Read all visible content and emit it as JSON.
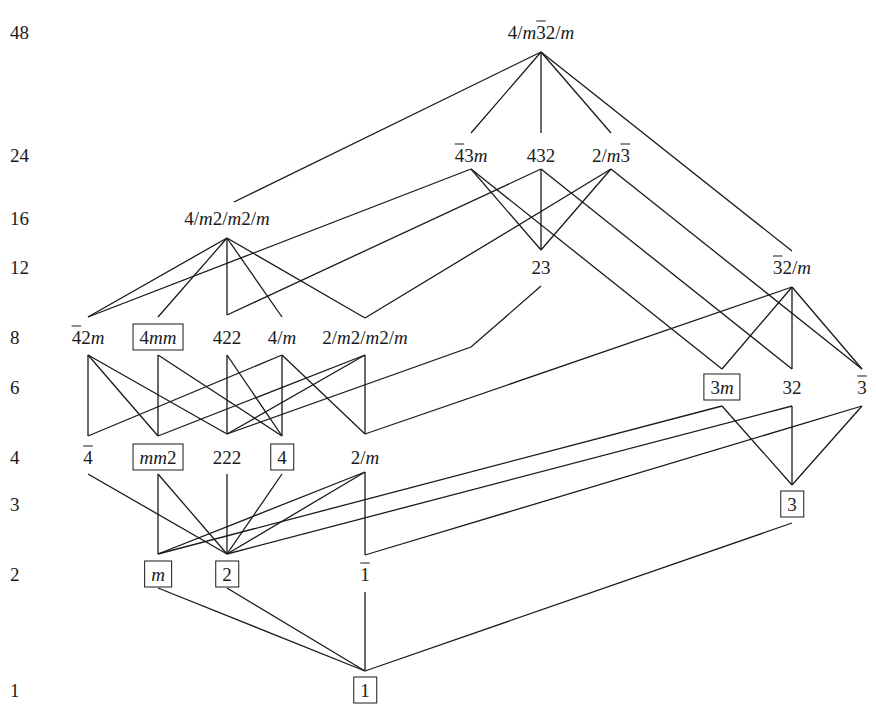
{
  "figure": {
    "order_axis_labels": [
      {
        "value": "48",
        "y": 32
      },
      {
        "value": "24",
        "y": 155
      },
      {
        "value": "16",
        "y": 218
      },
      {
        "value": "12",
        "y": 267
      },
      {
        "value": "8",
        "y": 337
      },
      {
        "value": "6",
        "y": 387
      },
      {
        "value": "4",
        "y": 457
      },
      {
        "value": "3",
        "y": 504
      },
      {
        "value": "2",
        "y": 574
      },
      {
        "value": "1",
        "y": 690
      }
    ],
    "nodes": [
      {
        "id": "m3m",
        "html": "4/<i>m</i><span class='ob'>3</span>2/<i>m</i>",
        "text": "4/m̅2/m (4/m 3̅ 2/m)",
        "x": 541,
        "y": 32,
        "boxed": false,
        "order": 48
      },
      {
        "id": "-43m",
        "html": "<span class='ob'>4</span>3<i>m</i>",
        "text": "4̅3m",
        "x": 471,
        "y": 155,
        "boxed": false,
        "order": 24
      },
      {
        "id": "432",
        "html": "432",
        "text": "432",
        "x": 541,
        "y": 155,
        "boxed": false,
        "order": 24
      },
      {
        "id": "m-3",
        "html": "2/<i>m</i><span class='ob'>3</span>",
        "text": "2/m3̅",
        "x": 611,
        "y": 155,
        "boxed": false,
        "order": 24
      },
      {
        "id": "4/mmm",
        "html": "4/<i>m</i>2/<i>m</i>2/<i>m</i>",
        "text": "4/m2/m2/m",
        "x": 227,
        "y": 218,
        "boxed": false,
        "order": 16
      },
      {
        "id": "23",
        "html": "23",
        "text": "23",
        "x": 541,
        "y": 267,
        "boxed": false,
        "order": 12
      },
      {
        "id": "-3m",
        "html": "<span class='ob'>3</span>2/<i>m</i>",
        "text": "3̅2/m",
        "x": 792,
        "y": 267,
        "boxed": false,
        "order": 12
      },
      {
        "id": "-42m",
        "html": "<span class='ob'>4</span>2<i>m</i>",
        "text": "4̅2m",
        "x": 88,
        "y": 337,
        "boxed": false,
        "order": 8
      },
      {
        "id": "4mm",
        "html": "4<i>mm</i>",
        "text": "4mm",
        "x": 158,
        "y": 337,
        "boxed": true,
        "order": 8
      },
      {
        "id": "422",
        "html": "422",
        "text": "422",
        "x": 227,
        "y": 337,
        "boxed": false,
        "order": 8
      },
      {
        "id": "4/m",
        "html": "4/<i>m</i>",
        "text": "4/m",
        "x": 282,
        "y": 337,
        "boxed": false,
        "order": 8
      },
      {
        "id": "mmm",
        "html": "2/<i>m</i>2/<i>m</i>2/<i>m</i>",
        "text": "2/m2/m2/m",
        "x": 365,
        "y": 337,
        "boxed": false,
        "order": 8
      },
      {
        "id": "3m",
        "html": "3<i>m</i>",
        "text": "3m",
        "x": 722,
        "y": 387,
        "boxed": true,
        "order": 6
      },
      {
        "id": "32",
        "html": "32",
        "text": "32",
        "x": 792,
        "y": 387,
        "boxed": false,
        "order": 6
      },
      {
        "id": "-3",
        "html": "<span class='ob'>3</span>",
        "text": "3̅",
        "x": 862,
        "y": 387,
        "boxed": false,
        "order": 6
      },
      {
        "id": "-4",
        "html": "<span class='ob'>4</span>",
        "text": "4̅",
        "x": 88,
        "y": 457,
        "boxed": false,
        "order": 4
      },
      {
        "id": "mm2",
        "html": "<i>mm</i>2",
        "text": "mm2",
        "x": 158,
        "y": 457,
        "boxed": true,
        "order": 4
      },
      {
        "id": "222",
        "html": "222",
        "text": "222",
        "x": 227,
        "y": 457,
        "boxed": false,
        "order": 4
      },
      {
        "id": "4",
        "html": "4",
        "text": "4",
        "x": 282,
        "y": 457,
        "boxed": true,
        "order": 4
      },
      {
        "id": "2/m",
        "html": "2/<i>m</i>",
        "text": "2/m",
        "x": 365,
        "y": 457,
        "boxed": false,
        "order": 4
      },
      {
        "id": "3",
        "html": "3",
        "text": "3",
        "x": 792,
        "y": 504,
        "boxed": true,
        "order": 3
      },
      {
        "id": "m",
        "html": "<i>m</i>",
        "text": "m",
        "x": 158,
        "y": 574,
        "boxed": true,
        "order": 2
      },
      {
        "id": "2",
        "html": "2",
        "text": "2",
        "x": 227,
        "y": 574,
        "boxed": true,
        "order": 2
      },
      {
        "id": "-1",
        "html": "<span class='ob'>1</span>",
        "text": "1̅",
        "x": 365,
        "y": 574,
        "boxed": false,
        "order": 2
      },
      {
        "id": "1",
        "html": "1",
        "text": "1",
        "x": 365,
        "y": 690,
        "boxed": true,
        "order": 1
      }
    ],
    "anchors": {
      "m3m": {
        "b": [
          541,
          52
        ]
      },
      "-43m": {
        "t": [
          471,
          133
        ],
        "b": [
          471,
          169
        ]
      },
      "432": {
        "t": [
          541,
          133
        ],
        "b": [
          541,
          169
        ]
      },
      "m-3": {
        "t": [
          611,
          133
        ],
        "b": [
          611,
          169
        ]
      },
      "4/mmm": {
        "t": [
          234,
          202
        ],
        "b": [
          227,
          238
        ]
      },
      "23": {
        "t": [
          541,
          250
        ],
        "b": [
          541,
          286
        ]
      },
      "-3m": {
        "t": [
          792,
          251
        ],
        "b": [
          792,
          287
        ]
      },
      "-42m": {
        "t": [
          88,
          317
        ],
        "b": [
          88,
          355
        ]
      },
      "4mm": {
        "t": [
          158,
          317
        ],
        "b": [
          158,
          355
        ]
      },
      "422": {
        "t": [
          227,
          315
        ],
        "b": [
          227,
          355
        ]
      },
      "4/m": {
        "t": [
          282,
          317
        ],
        "b": [
          282,
          355
        ]
      },
      "mmm": {
        "t": [
          365,
          318
        ],
        "b": [
          365,
          355
        ]
      },
      "3m": {
        "t": [
          722,
          369
        ],
        "b": [
          722,
          406
        ]
      },
      "32": {
        "t": [
          792,
          369
        ],
        "b": [
          792,
          406
        ]
      },
      "-3": {
        "t": [
          862,
          369
        ],
        "b": [
          862,
          406
        ]
      },
      "-4": {
        "t": [
          88,
          436
        ],
        "b": [
          88,
          474
        ]
      },
      "mm2": {
        "t": [
          158,
          436
        ],
        "b": [
          158,
          474
        ]
      },
      "222": {
        "t": [
          227,
          434
        ],
        "b": [
          227,
          474
        ]
      },
      "4": {
        "t": [
          282,
          436
        ],
        "b": [
          282,
          474
        ]
      },
      "2/m": {
        "t": [
          365,
          434
        ],
        "b": [
          365,
          472
        ]
      },
      "3": {
        "t": [
          792,
          485
        ],
        "b": [
          792,
          523
        ]
      },
      "m": {
        "t": [
          158,
          554
        ],
        "b": [
          158,
          588
        ]
      },
      "2": {
        "t": [
          227,
          554
        ],
        "b": [
          227,
          588
        ]
      },
      "-1": {
        "t": [
          365,
          555
        ],
        "b": [
          365,
          592
        ]
      },
      "1": {
        "t": [
          365,
          671
        ]
      }
    },
    "edges": [
      [
        "m3m",
        "4/mmm"
      ],
      [
        "m3m",
        "-43m"
      ],
      [
        "m3m",
        "432"
      ],
      [
        "m3m",
        "m-3"
      ],
      [
        "m3m",
        "-3m"
      ],
      [
        "-43m",
        "-42m"
      ],
      [
        "-43m",
        "23"
      ],
      [
        "-43m",
        "3m"
      ],
      [
        "432",
        "422"
      ],
      [
        "432",
        "23"
      ],
      [
        "432",
        "32"
      ],
      [
        "m-3",
        "mmm"
      ],
      [
        "m-3",
        "23"
      ],
      [
        "m-3",
        "-3"
      ],
      [
        "4/mmm",
        "-42m"
      ],
      [
        "4/mmm",
        "4mm"
      ],
      [
        "4/mmm",
        "422"
      ],
      [
        "4/mmm",
        "4/m"
      ],
      [
        "4/mmm",
        "mmm"
      ],
      [
        "-3m",
        "3m"
      ],
      [
        "-3m",
        "32"
      ],
      [
        "-3m",
        "-3"
      ],
      [
        "-3m",
        "2/m"
      ],
      [
        "-42m",
        "-4"
      ],
      [
        "-42m",
        "mm2"
      ],
      [
        "-42m",
        "222"
      ],
      [
        "4mm",
        "mm2"
      ],
      [
        "4mm",
        "4"
      ],
      [
        "422",
        "222"
      ],
      [
        "422",
        "4"
      ],
      [
        "4/m",
        "-4"
      ],
      [
        "4/m",
        "4"
      ],
      [
        "4/m",
        "2/m"
      ],
      [
        "mmm",
        "mm2"
      ],
      [
        "mmm",
        "222"
      ],
      [
        "mmm",
        "2/m"
      ],
      [
        "-4",
        "2"
      ],
      [
        "mm2",
        "m"
      ],
      [
        "mm2",
        "2"
      ],
      [
        "222",
        "2"
      ],
      [
        "4",
        "2"
      ],
      [
        "2/m",
        "m"
      ],
      [
        "2/m",
        "2"
      ],
      [
        "2/m",
        "-1"
      ],
      [
        "3m",
        "3"
      ],
      [
        "3m",
        "m"
      ],
      [
        "32",
        "3"
      ],
      [
        "32",
        "2"
      ],
      [
        "-3",
        "3"
      ],
      [
        "-3",
        "-1"
      ],
      [
        "3",
        "1"
      ],
      [
        "m",
        "1"
      ],
      [
        "2",
        "1"
      ],
      [
        "-1",
        "1"
      ]
    ],
    "polyline_edges": [
      {
        "from": "23",
        "to": "222",
        "points": [
          [
            541,
            286
          ],
          [
            471,
            347
          ],
          [
            227,
            434
          ]
        ]
      }
    ],
    "colors": {
      "line": "#1a1a1a",
      "background": "#ffffff"
    }
  }
}
